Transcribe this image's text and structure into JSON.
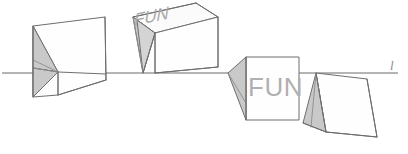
{
  "diagram": {
    "background_color": "#ffffff",
    "line_color": "#6e6e6e",
    "shade_color": "#c9c9c9",
    "text_color": "#b0b0b0",
    "horizon": {
      "label": "l",
      "y": 73,
      "x_start": 2,
      "x_end": 398
    },
    "cubes": [
      {
        "id": "cube-1",
        "position": "left",
        "text": "",
        "text_face": "none",
        "note": "cube rotated nearly edge-on, shaded left face collapsed to narrow wedge"
      },
      {
        "id": "cube-2",
        "position": "left-center",
        "text": "FUN",
        "text_face": "top",
        "note": "cube seen from above, FUN on top face, shaded narrow left face"
      },
      {
        "id": "cube-3",
        "position": "right-center",
        "text": "FUN",
        "text_face": "front",
        "note": "cube seen frontally, FUN on front face, shaded left triangular face"
      },
      {
        "id": "cube-4",
        "position": "right",
        "text": "",
        "text_face": "none",
        "note": "cube rotated away, large shaded left triangular face below the line"
      }
    ]
  }
}
